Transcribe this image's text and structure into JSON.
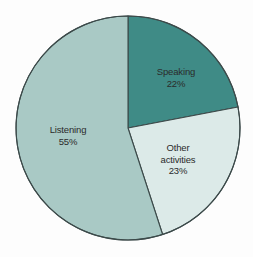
{
  "chart_data": {
    "type": "pie",
    "title": "",
    "subtitle": "",
    "xlabel": "",
    "ylabel": "",
    "legend_position": "none",
    "grid": false,
    "labels_inside_slices": true,
    "categories": [
      "Speaking",
      "Other activities",
      "Listening"
    ],
    "values": [
      22,
      23,
      55
    ],
    "unit": "%",
    "slices": [
      {
        "name": "Speaking",
        "label_line1": "Speaking",
        "label_line2": "",
        "value": 22,
        "value_label": "22%",
        "color": "#3f8b86",
        "start_angle_deg": 0,
        "end_angle_deg": 79.2
      },
      {
        "name": "Other activities",
        "label_line1": "Other",
        "label_line2": "activities",
        "value": 23,
        "value_label": "23%",
        "color": "#dceae8",
        "start_angle_deg": 79.2,
        "end_angle_deg": 162
      },
      {
        "name": "Listening",
        "label_line1": "Listening",
        "label_line2": "",
        "value": 55,
        "value_label": "55%",
        "color": "#a9c9c5",
        "start_angle_deg": 162,
        "end_angle_deg": 360
      }
    ],
    "geometry": {
      "center_x": 128,
      "center_y": 128,
      "radius": 112
    },
    "colors": {
      "background": "#fdfdfd",
      "outline": "#3c4a4a",
      "text": "#2b2b2b",
      "speaking": "#3f8b86",
      "other_activities": "#dceae8",
      "listening": "#a9c9c5"
    }
  }
}
